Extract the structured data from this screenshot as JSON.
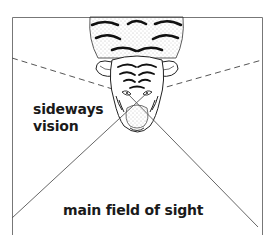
{
  "diagram": {
    "labels": {
      "sideways_line1": "sideways",
      "sideways_line2": "vision",
      "main": "main field of sight"
    },
    "colors": {
      "line": "#555555",
      "ink": "#1a1a1a",
      "background": "#ffffff"
    }
  }
}
